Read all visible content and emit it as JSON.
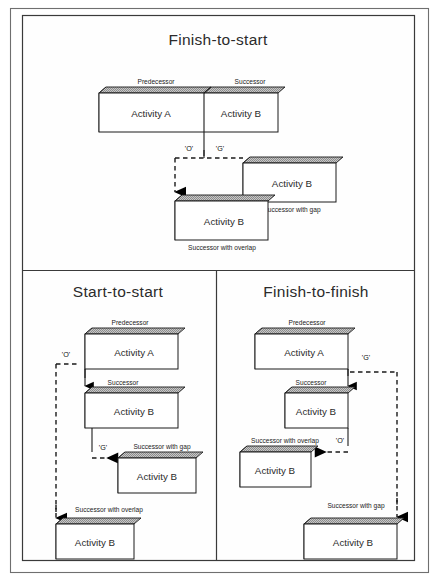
{
  "figure": {
    "title_top": "Finish-to-start",
    "title_bottom_left": "Start-to-start",
    "title_bottom_right": "Finish-to-finish"
  },
  "labels": {
    "predecessor": "Predecessor",
    "successor": "Successor",
    "successor_gap": "Successor with gap",
    "successor_overlap": "Successor with overlap",
    "activity_a": "Activity A",
    "activity_b": "Activity B",
    "overlap_marker": "'O'",
    "gap_marker": "'G'"
  },
  "colors": {
    "frame": "#6f6f6f",
    "panel_border": "#3a3a3a",
    "line": "#1a1a1a",
    "bar_face": "#ffffff",
    "bar_top": "#b9b9b9",
    "bar_side_dark": "#111111",
    "bar_side_light": "#8a8a8a",
    "text": "#2b2b2b"
  },
  "panels": [
    {
      "id": "finish-to-start",
      "title": "Finish-to-start",
      "bars": [
        {
          "name": "predecessor-bar",
          "label": "Activity A",
          "caption": "Predecessor"
        },
        {
          "name": "successor-bar",
          "label": "Activity B",
          "caption": "Successor"
        },
        {
          "name": "successor-gap-bar",
          "label": "Activity B",
          "caption": "Successor with gap"
        },
        {
          "name": "successor-overlap-bar",
          "label": "Activity B",
          "caption": "Successor with overlap"
        }
      ],
      "markers": [
        "'O'",
        "'G'"
      ]
    },
    {
      "id": "start-to-start",
      "title": "Start-to-start",
      "bars": [
        {
          "name": "predecessor-bar",
          "label": "Activity A",
          "caption": "Predecessor"
        },
        {
          "name": "successor-bar",
          "label": "Activity B",
          "caption": "Successor"
        },
        {
          "name": "successor-gap-bar",
          "label": "Activity B",
          "caption": "Successor with gap"
        },
        {
          "name": "successor-overlap-bar",
          "label": "Activity B",
          "caption": "Successor with overlap"
        }
      ],
      "markers": [
        "'O'",
        "'G'"
      ]
    },
    {
      "id": "finish-to-finish",
      "title": "Finish-to-finish",
      "bars": [
        {
          "name": "predecessor-bar",
          "label": "Activity A",
          "caption": "Predecessor"
        },
        {
          "name": "successor-bar",
          "label": "Activity B",
          "caption": "Successor"
        },
        {
          "name": "successor-overlap-bar",
          "label": "Activity B",
          "caption": "Successor with overlap"
        },
        {
          "name": "successor-gap-bar",
          "label": "Activity B",
          "caption": "Successor with gap"
        }
      ],
      "markers": [
        "'G'",
        "'O'"
      ]
    }
  ]
}
